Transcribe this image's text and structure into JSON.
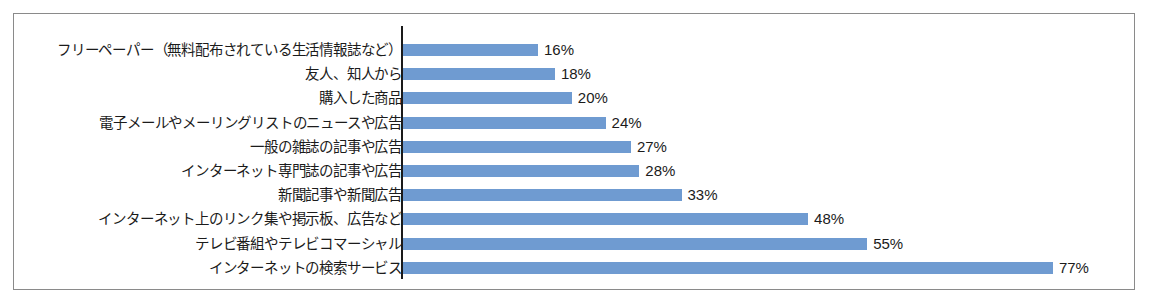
{
  "chart_data": {
    "type": "bar",
    "orientation": "horizontal",
    "title": "",
    "subtitle": "",
    "xlabel": "",
    "ylabel": "",
    "grid": false,
    "legend": false,
    "value_suffix": "%",
    "xlim": [
      0,
      77
    ],
    "axis_line": "category",
    "categories": [
      "フリーペーパー（無料配布されている生活情報誌など）",
      "友人、知人から",
      "購入した商品",
      "電子メールやメーリングリストのニュースや広告",
      "一般の雑誌の記事や広告",
      "インターネット専門誌の記事や広告",
      "新聞記事や新聞広告",
      "インターネット上のリンク集や掲示板、広告など",
      "テレビ番組やテレビコマーシャル",
      "インターネットの検索サービス"
    ],
    "values": [
      16,
      18,
      20,
      24,
      27,
      28,
      33,
      48,
      55,
      77
    ],
    "value_labels": [
      "16%",
      "18%",
      "20%",
      "24%",
      "27%",
      "28%",
      "33%",
      "48%",
      "55%",
      "77%"
    ],
    "series": [
      {
        "name": "",
        "values": [
          16,
          18,
          20,
          24,
          27,
          28,
          33,
          48,
          55,
          77
        ]
      }
    ],
    "colors": {
      "bar": "#6f9bd1",
      "text": "#1b1b1b",
      "axis_line": "#1a1a1a",
      "frame_border": "#8a8a8a",
      "background": "#ffffff"
    }
  }
}
